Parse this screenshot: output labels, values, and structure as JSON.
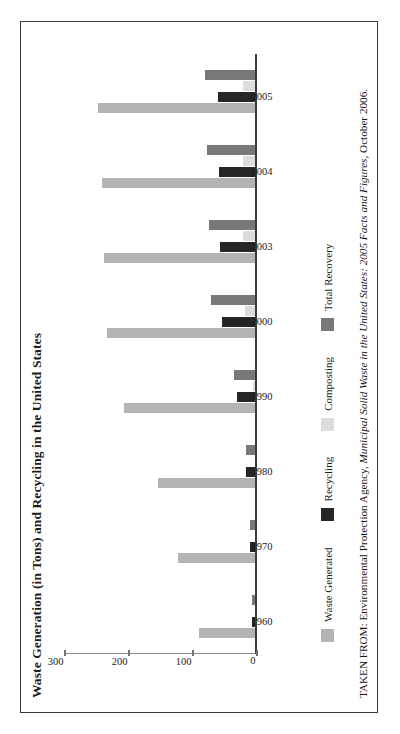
{
  "figure": {
    "title": "Waste Generation (in Tons) and Recycling in the United States",
    "source_prefix": "TAKEN FROM: Environmental Protection Agency, ",
    "source_italic": "Municipal Solid Waste in the United States: 2005 Facts and Figures,",
    "source_suffix": " October 2006."
  },
  "colors": {
    "waste_generated": "#b3b3b3",
    "recycling": "#262626",
    "composting": "#dcdcdc",
    "total_recovery": "#787878",
    "axis": "#3b3b3b",
    "frame": "#3a3a3a"
  },
  "chart_data": {
    "type": "bar",
    "title": "Waste Generation (in Tons) and Recycling in the United States",
    "xlabel": "",
    "ylabel": "",
    "ylim": [
      0,
      300
    ],
    "yticks": [
      0,
      100,
      200,
      300
    ],
    "ytick_labels": [
      "0",
      "100",
      "200",
      "300"
    ],
    "grid": false,
    "legend_position": "bottom",
    "orientation": "rotated-90",
    "categories": [
      "1960",
      "1970",
      "1980",
      "1990",
      "2000",
      "2003",
      "2004",
      "2005"
    ],
    "series": [
      {
        "name": "Waste Generated",
        "color": "#b3b3b3",
        "values": [
          88,
          121,
          152,
          205,
          232,
          236,
          239,
          246
        ]
      },
      {
        "name": "Recycling",
        "color": "#262626",
        "values": [
          6,
          8,
          14,
          29,
          53,
          55,
          57,
          58
        ]
      },
      {
        "name": "Composting",
        "color": "#dcdcdc",
        "values": [
          0,
          0,
          0,
          4,
          16,
          19,
          20,
          20
        ]
      },
      {
        "name": "Total Recovery",
        "color": "#787878",
        "values": [
          6,
          8,
          14,
          33,
          69,
          72,
          76,
          79
        ]
      }
    ]
  },
  "legend": {
    "items": [
      {
        "label": "Waste Generated",
        "color": "#b3b3b3"
      },
      {
        "label": "Recycling",
        "color": "#262626"
      },
      {
        "label": "Composting",
        "color": "#dcdcdc"
      },
      {
        "label": "Total Recovery",
        "color": "#787878"
      }
    ]
  }
}
